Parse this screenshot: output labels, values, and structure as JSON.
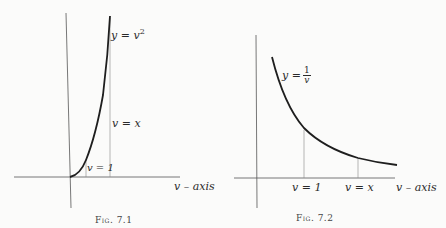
{
  "figures": [
    {
      "caption": "Fig. 7.1",
      "curve_label_prefix": "y = v",
      "curve_label_exp": "2",
      "line_labels": {
        "left": "v = 1",
        "right": "v = x"
      },
      "axis_label": "v – axis"
    },
    {
      "caption": "Fig. 7.2",
      "curve_label_prefix": "y =",
      "curve_label_num": "1",
      "curve_label_den": "v",
      "line_labels": {
        "left": "v = 1",
        "right": "v = x"
      },
      "axis_label": "v – axis"
    }
  ],
  "colors": {
    "ink": "#2a2a2a",
    "paper": "#fbfbfa",
    "thin_line": "#777777"
  }
}
